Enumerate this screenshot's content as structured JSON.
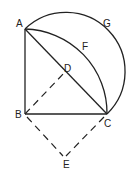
{
  "diagram": {
    "points": {
      "A": {
        "label": "A",
        "x": 25,
        "y": 29
      },
      "B": {
        "label": "B",
        "x": 25,
        "y": 114
      },
      "C": {
        "label": "C",
        "x": 107,
        "y": 114
      },
      "D": {
        "label": "D",
        "x": 66,
        "y": 71
      },
      "E": {
        "label": "E",
        "x": 64,
        "y": 156
      },
      "F": {
        "label": "F"
      },
      "G": {
        "label": "G"
      }
    },
    "segments": [
      {
        "from": "A",
        "to": "B",
        "style": "solid"
      },
      {
        "from": "B",
        "to": "C",
        "style": "solid"
      },
      {
        "from": "A",
        "to": "C",
        "style": "solid"
      },
      {
        "from": "B",
        "to": "D",
        "style": "dashed"
      },
      {
        "from": "B",
        "to": "E",
        "style": "dashed"
      },
      {
        "from": "C",
        "to": "E",
        "style": "dashed"
      }
    ],
    "arcs": [
      {
        "name": "AFC",
        "center": "B",
        "style": "solid"
      },
      {
        "name": "AGC",
        "center": "D",
        "style": "solid"
      }
    ]
  }
}
